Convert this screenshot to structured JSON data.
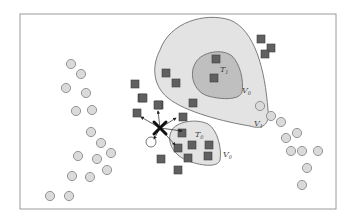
{
  "diagram": {
    "frame": {
      "x": 20,
      "y": 14,
      "w": 316,
      "h": 195,
      "stroke": "#9a9a9a"
    },
    "colors": {
      "outer_region_fill": "#e3e3e3",
      "outer_region_stroke": "#6f6f6f",
      "inner_region_fill": "#bfbfbf",
      "square_fill": "#606060",
      "square_stroke": "#3c3c3c",
      "circle_fill": "#dadada",
      "circle_stroke": "#8a8a8a",
      "query_mark": "#111111"
    },
    "labels": {
      "t1": "T",
      "t1_sub": "1",
      "v0_upper": "V",
      "v0_upper_sub": "0",
      "v1": "V",
      "v1_sub": "1",
      "t0": "T",
      "t0_sub": "0",
      "v0_lower": "V",
      "v0_lower_sub": "0"
    },
    "squares": [
      [
        261,
        39
      ],
      [
        271,
        48
      ],
      [
        265,
        54
      ],
      [
        216,
        59
      ],
      [
        214,
        78
      ],
      [
        166,
        73
      ],
      [
        176,
        83
      ],
      [
        135,
        84
      ],
      [
        142,
        98
      ],
      [
        143,
        98
      ],
      [
        193,
        103
      ],
      [
        159,
        105
      ],
      [
        137,
        113
      ],
      [
        158,
        105
      ],
      [
        183,
        117
      ],
      [
        182,
        133
      ],
      [
        178,
        148
      ],
      [
        192,
        145
      ],
      [
        209,
        145
      ],
      [
        188,
        158
      ],
      [
        208,
        156
      ],
      [
        161,
        159
      ],
      [
        178,
        170
      ]
    ],
    "circles": [
      [
        71,
        64
      ],
      [
        81,
        74
      ],
      [
        66,
        88
      ],
      [
        86,
        93
      ],
      [
        76,
        111
      ],
      [
        92,
        110
      ],
      [
        91,
        132
      ],
      [
        101,
        143
      ],
      [
        111,
        153
      ],
      [
        78,
        156
      ],
      [
        97,
        159
      ],
      [
        107,
        170
      ],
      [
        72,
        176
      ],
      [
        90,
        177
      ],
      [
        50,
        196
      ],
      [
        69,
        196
      ],
      [
        260,
        106
      ],
      [
        271,
        116
      ],
      [
        281,
        122
      ],
      [
        286,
        138
      ],
      [
        297,
        133
      ],
      [
        291,
        151
      ],
      [
        302,
        151
      ],
      [
        318,
        151
      ],
      [
        307,
        168
      ],
      [
        302,
        185
      ]
    ],
    "query_point": {
      "x": 160,
      "y": 128
    },
    "query_target_circle": {
      "x": 151,
      "y": 142
    },
    "arrows": [
      [
        158,
        111
      ],
      [
        141,
        117
      ],
      [
        176,
        118
      ],
      [
        182,
        131
      ],
      [
        175,
        145
      ],
      [
        154,
        139
      ]
    ]
  }
}
